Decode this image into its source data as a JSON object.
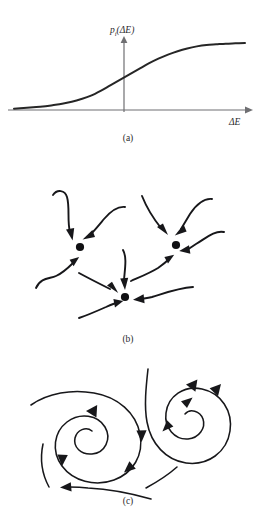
{
  "figure": {
    "background_color": "#ffffff",
    "ink_color": "#17171a",
    "axis_color": "#6f6f72",
    "curve_color": "#262626"
  },
  "panels": [
    {
      "id": "a",
      "caption": "(a)",
      "caption_x": 128,
      "caption_y": 141,
      "type": "plot",
      "y_axis_label_base": "p",
      "y_axis_label_sub": "i",
      "y_axis_label_arg": "(ΔE)",
      "y_axis_label_full": "p_i(ΔE)",
      "x_axis_label": "ΔE"
    },
    {
      "id": "b",
      "caption": "(b)",
      "caption_x": 128,
      "caption_y": 172,
      "type": "attractor-nodes",
      "node_count": 3
    },
    {
      "id": "c",
      "caption": "(c)",
      "caption_x": 128,
      "caption_y": 144,
      "type": "spiral-flow",
      "spiral_count": 2
    }
  ],
  "chart_data": {
    "type": "line",
    "title": "",
    "subtitle": "",
    "xlabel": "ΔE",
    "ylabel": "p_i(ΔE)",
    "grid": false,
    "legend": null,
    "axis_origin_px": {
      "x": 124,
      "y": 110
    },
    "x_axis_span_px": [
      8,
      250
    ],
    "y_axis_span_px": [
      110,
      38
    ],
    "xlim": [
      -6,
      6
    ],
    "ylim": [
      0,
      1
    ],
    "x": [
      -6,
      -5.5,
      -5,
      -4.5,
      -4,
      -3.5,
      -3,
      -2.5,
      -2,
      -1.5,
      -1,
      -0.5,
      0,
      0.5,
      1,
      1.5,
      2,
      2.5,
      3,
      3.5,
      4,
      4.5,
      5,
      5.5,
      6
    ],
    "values": [
      0.02,
      0.03,
      0.04,
      0.05,
      0.07,
      0.09,
      0.12,
      0.16,
      0.21,
      0.28,
      0.36,
      0.44,
      0.52,
      0.6,
      0.68,
      0.75,
      0.81,
      0.86,
      0.9,
      0.93,
      0.95,
      0.96,
      0.97,
      0.975,
      0.98
    ],
    "series": [
      {
        "name": "p_i(ΔE)",
        "values": [
          0.02,
          0.03,
          0.04,
          0.05,
          0.07,
          0.09,
          0.12,
          0.16,
          0.21,
          0.28,
          0.36,
          0.44,
          0.52,
          0.6,
          0.68,
          0.75,
          0.81,
          0.86,
          0.9,
          0.93,
          0.95,
          0.96,
          0.97,
          0.975,
          0.98
        ]
      }
    ],
    "xticks": [],
    "yticks": [],
    "xticklabels": [],
    "yticklabels": []
  },
  "panel_b_nodes": [
    {
      "name": "node-left",
      "cx": 80,
      "cy": 77,
      "r": 4.1,
      "incoming_arrows": 3
    },
    {
      "name": "node-right",
      "cx": 176,
      "cy": 75,
      "r": 4.1,
      "incoming_arrows": 4
    },
    {
      "name": "node-bottom",
      "cx": 125,
      "cy": 127,
      "r": 4.1,
      "incoming_arrows": 4
    }
  ],
  "panel_c_spirals": [
    {
      "name": "spiral-left",
      "cx": 94,
      "cy": 77,
      "direction": "clockwise-inward",
      "turns": 2.4
    },
    {
      "name": "spiral-right",
      "cx": 186,
      "cy": 64,
      "direction": "clockwise-inward",
      "turns": 2.1
    }
  ]
}
